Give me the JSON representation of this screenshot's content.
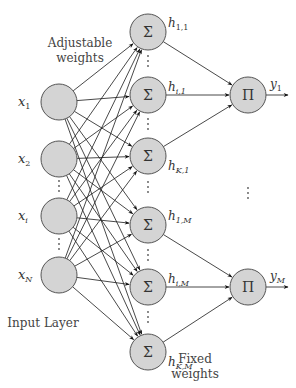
{
  "diagram": {
    "captions": {
      "adjustable_weights_line1": "Adjustable",
      "adjustable_weights_line2": "weights",
      "fixed_weights_line1": "Fixed",
      "fixed_weights_line2": "weights",
      "input_layer": "Input Layer"
    },
    "input_nodes": [
      {
        "id": "x1",
        "label": "x",
        "sub": "1"
      },
      {
        "id": "x2",
        "label": "x",
        "sub": "2"
      },
      {
        "id": "xi",
        "label": "x",
        "sub": "i"
      },
      {
        "id": "xN",
        "label": "x",
        "sub": "N"
      }
    ],
    "sum_nodes": [
      {
        "id": "h11",
        "symbol": "Σ",
        "label": "h",
        "sub": "1,1",
        "group": 0
      },
      {
        "id": "hi1",
        "symbol": "Σ",
        "label": "h",
        "sub": "i,1",
        "group": 0
      },
      {
        "id": "hK1",
        "symbol": "Σ",
        "label": "h",
        "sub": "K,1",
        "group": 0
      },
      {
        "id": "h1M",
        "symbol": "Σ",
        "label": "h",
        "sub": "1,M",
        "group": 1
      },
      {
        "id": "hiM",
        "symbol": "Σ",
        "label": "h",
        "sub": "i,M",
        "group": 1
      },
      {
        "id": "hKM",
        "symbol": "Σ",
        "label": "h",
        "sub": "K,M",
        "group": 1
      }
    ],
    "product_nodes": [
      {
        "id": "y1",
        "symbol": "Π",
        "label": "y",
        "sub": "1"
      },
      {
        "id": "yM",
        "symbol": "Π",
        "label": "y",
        "sub": "M"
      }
    ],
    "connections": {
      "input_to_sum": "fully-connected",
      "sum_to_product": "grouped"
    },
    "ellipsis": "⋮"
  }
}
